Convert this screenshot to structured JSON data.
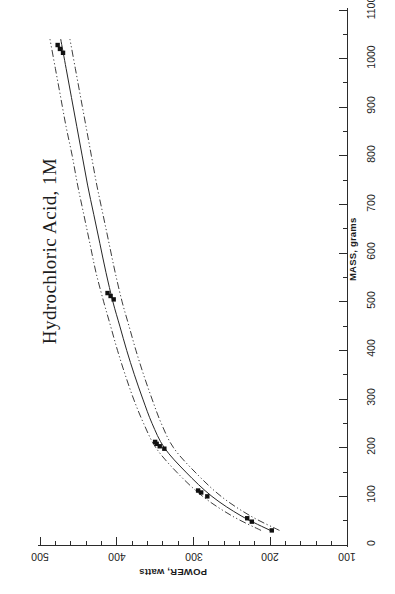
{
  "chart_title": "Hydrochloric Acid, 1M",
  "axes": {
    "mass": {
      "title": "MASS, grams",
      "ticks": [
        "0",
        "100",
        "200",
        "300",
        "400",
        "500",
        "600",
        "700",
        "800",
        "900",
        "1000",
        "1100"
      ]
    },
    "power": {
      "title": "POWER, watts",
      "ticks": [
        "100",
        "200",
        "300",
        "400",
        "500"
      ]
    }
  },
  "chart_data": {
    "type": "scatter",
    "title": "Hydrochloric Acid, 1M",
    "xlabel": "MASS, grams",
    "ylabel": "POWER, watts",
    "xlim": [
      0,
      1100
    ],
    "ylim": [
      100,
      500
    ],
    "grid": false,
    "legend": null,
    "orientation": "rotated-90-ccw",
    "series": [
      {
        "name": "Measured data",
        "marker": "filled-square",
        "x": [
          30,
          48,
          55,
          100,
          108,
          112,
          198,
          203,
          208,
          212,
          505,
          512,
          518,
          1012,
          1020,
          1028
        ],
        "y": [
          198,
          224,
          230,
          282,
          290,
          294,
          338,
          344,
          348,
          350,
          404,
          408,
          412,
          470,
          474,
          477
        ]
      },
      {
        "name": "Fitted curve",
        "style": "solid",
        "x": [
          30,
          60,
          100,
          150,
          200,
          250,
          300,
          350,
          400,
          450,
          500,
          560,
          620,
          680,
          740,
          800,
          860,
          920,
          980,
          1040
        ],
        "y": [
          200,
          238,
          276,
          310,
          338,
          354,
          366,
          377,
          387,
          396,
          405,
          414,
          422,
          430,
          438,
          445,
          452,
          459,
          466,
          473
        ]
      },
      {
        "name": "Upper confidence band",
        "style": "dash-dot-dot",
        "x": [
          30,
          60,
          100,
          150,
          200,
          250,
          300,
          350,
          400,
          450,
          500,
          560,
          620,
          680,
          740,
          800,
          860,
          920,
          980,
          1040
        ],
        "y": [
          212,
          250,
          288,
          322,
          349,
          365,
          378,
          389,
          399,
          408,
          417,
          427,
          435,
          443,
          451,
          458,
          466,
          473,
          480,
          487
        ]
      },
      {
        "name": "Lower confidence band",
        "style": "dash-dot-dot",
        "x": [
          30,
          60,
          100,
          150,
          200,
          250,
          300,
          350,
          400,
          450,
          500,
          560,
          620,
          680,
          740,
          800,
          860,
          920,
          980,
          1040
        ],
        "y": [
          188,
          226,
          264,
          298,
          326,
          342,
          354,
          365,
          375,
          384,
          393,
          402,
          410,
          418,
          426,
          433,
          440,
          447,
          454,
          461
        ]
      }
    ]
  }
}
